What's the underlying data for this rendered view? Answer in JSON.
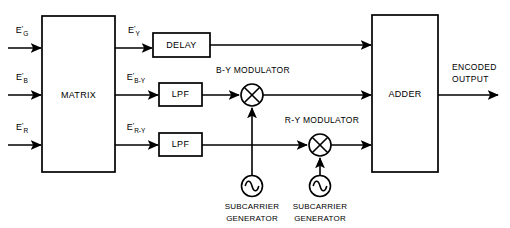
{
  "diagram": {
    "background_color": "#ffffff",
    "line_color": "#000000",
    "inputs": [
      {
        "id": "eg",
        "base": "E",
        "prime": "'",
        "sub": "G",
        "name": "green-primary-input"
      },
      {
        "id": "eb",
        "base": "E",
        "prime": "'",
        "sub": "B",
        "name": "blue-primary-input"
      },
      {
        "id": "er",
        "base": "E",
        "prime": "'",
        "sub": "R",
        "name": "red-primary-input"
      }
    ],
    "matrix": {
      "label": "MATRIX"
    },
    "matrix_outputs": [
      {
        "id": "ey",
        "base": "E",
        "prime": "'",
        "sub": "Y",
        "name": "luminance-signal-label"
      },
      {
        "id": "eby",
        "base": "E",
        "prime": "'",
        "sub": "B-Y",
        "name": "b-minus-y-signal-label"
      },
      {
        "id": "ery",
        "base": "E",
        "prime": "'",
        "sub": "R-Y",
        "name": "r-minus-y-signal-label"
      }
    ],
    "blocks": {
      "delay": "DELAY",
      "lpf_upper": "LPF",
      "lpf_lower": "LPF",
      "adder": "ADDER"
    },
    "modulators": [
      {
        "id": "by_mod",
        "label": "B-Y MODULATOR",
        "symbol": "multiplier-cross"
      },
      {
        "id": "ry_mod",
        "label": "R-Y MODULATOR",
        "symbol": "multiplier-cross"
      }
    ],
    "generators": [
      {
        "id": "gen1",
        "line1": "SUBCARRIER",
        "line2": "GENERATOR",
        "symbol": "sine-oscillator"
      },
      {
        "id": "gen2",
        "line1": "SUBCARRIER",
        "line2": "GENERATOR",
        "symbol": "sine-oscillator"
      }
    ],
    "output": {
      "line1": "ENCODED",
      "line2": "OUTPUT"
    }
  }
}
